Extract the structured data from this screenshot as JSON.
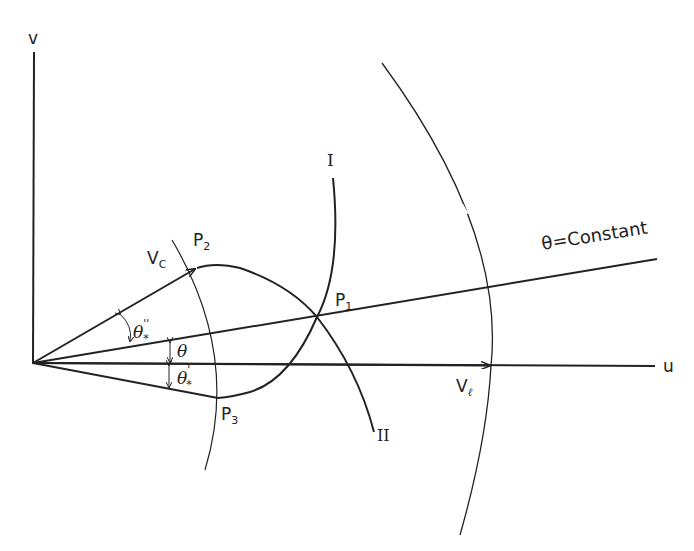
{
  "diagram": {
    "axes": {
      "vertical_label": "v",
      "horizontal_label": "u"
    },
    "vectors": {
      "vc_label": "V",
      "vc_sub": "C",
      "vl_label": "V",
      "vl_sub": "ℓ"
    },
    "points": {
      "p1": {
        "label": "P",
        "sub": "1"
      },
      "p2": {
        "label": "P",
        "sub": "2"
      },
      "p3": {
        "label": "P",
        "sub": "3"
      }
    },
    "curves": {
      "curve_1_label": "I",
      "curve_2_label": "II"
    },
    "line_label": "θ=Constant",
    "angles": {
      "theta": "θ",
      "theta_star_dprime": "θ",
      "theta_star_dprime_sup": "''",
      "theta_star_dprime_sub": "*",
      "theta_star_prime": "θ",
      "theta_star_prime_sup": "'",
      "theta_star_prime_sub": "*"
    },
    "colors": {
      "stroke": "#222222",
      "background": "#ffffff"
    }
  }
}
